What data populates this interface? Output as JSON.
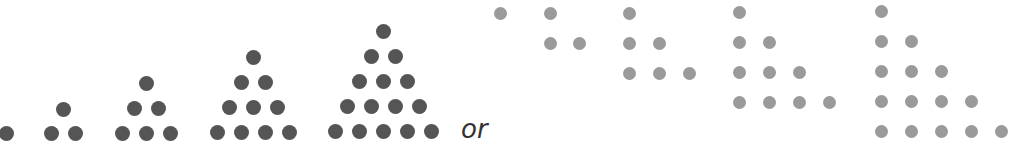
{
  "figure": {
    "connector_text": "or",
    "colors": {
      "equilateral_dots": "#555555",
      "right_angle_dots": "#9a9a9a"
    }
  },
  "equilateral_triangles": [
    {
      "rows": 1,
      "count": 1,
      "apex_x": 6,
      "base_y": 133,
      "spacing_x": 24,
      "spacing_y": 25
    },
    {
      "rows": 2,
      "count": 3,
      "apex_x": 63,
      "base_y": 133,
      "spacing_x": 24,
      "spacing_y": 24
    },
    {
      "rows": 3,
      "count": 6,
      "apex_x": 146,
      "base_y": 133,
      "spacing_x": 24,
      "spacing_y": 25
    },
    {
      "rows": 4,
      "count": 10,
      "apex_x": 253,
      "base_y": 132,
      "spacing_x": 24,
      "spacing_y": 25
    },
    {
      "rows": 5,
      "count": 15,
      "apex_x": 383,
      "base_y": 131,
      "spacing_x": 24,
      "spacing_y": 25
    }
  ],
  "right_triangles": [
    {
      "rows": 1,
      "count": 1,
      "left_x": 500,
      "top_y": 13,
      "spacing_x": 30,
      "spacing_y": 30
    },
    {
      "rows": 2,
      "count": 3,
      "left_x": 550,
      "top_y": 13,
      "spacing_x": 29,
      "spacing_y": 30
    },
    {
      "rows": 3,
      "count": 6,
      "left_x": 629,
      "top_y": 13,
      "spacing_x": 30,
      "spacing_y": 30
    },
    {
      "rows": 4,
      "count": 10,
      "left_x": 739,
      "top_y": 12,
      "spacing_x": 30,
      "spacing_y": 30
    },
    {
      "rows": 5,
      "count": 15,
      "left_x": 881,
      "top_y": 11,
      "spacing_x": 30,
      "spacing_y": 30
    }
  ]
}
